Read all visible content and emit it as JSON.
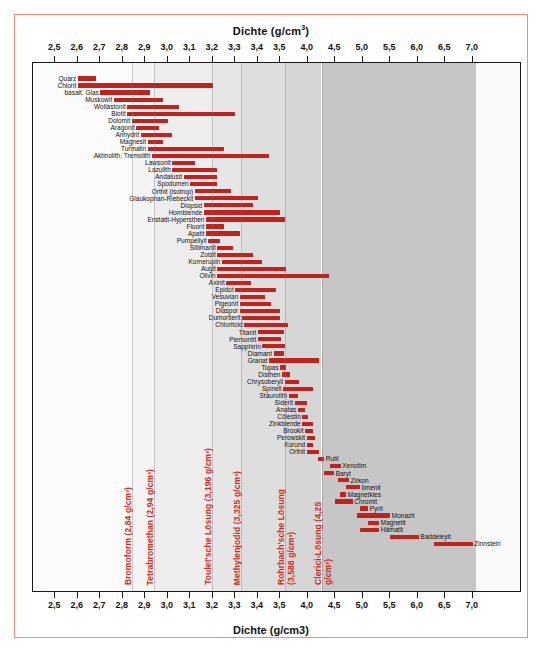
{
  "titles": {
    "top": "Dichte (g/cm",
    "top_sup": "3",
    "top_close": ")",
    "bottom": "Dichte (g/cm3)"
  },
  "axis": {
    "label": "Dichte (g/cm³)",
    "ticks": [
      "2,5",
      "2,6",
      "2,7",
      "2,8",
      "2,9",
      "3,0",
      "3,1",
      "3,2",
      "3,3",
      "3,4",
      "3,5",
      "4,0",
      "4,5",
      "5,0",
      "5,5",
      "6,0",
      "6,5",
      "7,0"
    ],
    "tick_values": [
      2.5,
      2.6,
      2.7,
      2.8,
      2.9,
      3.0,
      3.1,
      3.2,
      3.3,
      3.4,
      3.5,
      4.0,
      4.5,
      5.0,
      5.5,
      6.0,
      6.5,
      7.0
    ],
    "segment_break": 3.5,
    "min": 2.45,
    "max": 7.05
  },
  "colors": {
    "bar": "#c0221d",
    "solution_text": "#d22b20",
    "frame": "#f08c80",
    "plot_border": "#1a1a1a"
  },
  "solutions": [
    {
      "name": "Bromoform",
      "density": "2,84 g/cm³",
      "label": "Bromoform (2,84 g/cm³)",
      "value": 2.84
    },
    {
      "name": "Tetrabromethan",
      "density": "2,94 g/cm³",
      "label": "Tetrabromethan (2,94 g/cm³)",
      "value": 2.94
    },
    {
      "name": "Toulet'sche Lösung",
      "density": "3,196 g/cm³",
      "label": "Toulet'sche Lösung (3,196 g/cm³)",
      "value": 3.196
    },
    {
      "name": "Methylenjodid",
      "density": "3,325 g/cm³",
      "label": "Methylenjodid (3,325 g/cm³)",
      "value": 3.325
    },
    {
      "name": "Rohrbach'sche Lösung",
      "density": "3,588 g/cm³",
      "label": "Rohrbach'sche Lösung (3,588 g/cm³)",
      "value": 3.588
    },
    {
      "name": "Clerici-Lösung",
      "density": "4,25 g/cm³",
      "label": "Clerici-Lösung (4,25 g/cm³)",
      "value": 4.25
    }
  ],
  "chart_data": {
    "type": "bar",
    "orientation": "horizontal-range",
    "xlabel": "Dichte (g/cm³)",
    "ylabel": "",
    "xlim": [
      2.45,
      7.05
    ],
    "grid": false,
    "legend": "none",
    "note": "Broken/compressed x-axis: 2.5-3.5 in 0.1 steps, 4.0-7.0 in 0.5 steps",
    "categories": [
      "Quarz",
      "Chlorit",
      "basalt. Glas",
      "Muskowit",
      "Wollastonit",
      "Biotit",
      "Dolomit",
      "Aragonit",
      "Anhydrit",
      "Magnesit",
      "Turmalin",
      "Aktinolith, Tremolith",
      "Lawsonit",
      "Lazulith",
      "Andalusit",
      "Spodumen",
      "Orthit (isotrop)",
      "Glaukophan-Riebeckit",
      "Diopsid",
      "Hornblende",
      "Enstatit-Hypersthen",
      "Fluorit",
      "Apatit",
      "Pumpellyit",
      "Sillimanit",
      "Zoisit",
      "Kornerupin",
      "Augit",
      "Olivin",
      "Axinit",
      "Epidot",
      "Vesuvian",
      "Pigeonit",
      "Diaspor",
      "Dumortierit",
      "Chloritoid",
      "Titanit",
      "Piemontit",
      "Sapphirin",
      "Diamant",
      "Granat",
      "Topas",
      "Disthen",
      "Chrysoberyll",
      "Spinell",
      "Staurolith",
      "Siderit",
      "Anatas",
      "Cölestin",
      "Zinkblende",
      "Brookit",
      "Perowskit",
      "Korund",
      "Orthit",
      "Rutil",
      "Xenotim",
      "Baryt",
      "Zirkon",
      "Ilmenit",
      "Magnetkies",
      "Chromit",
      "Pyrit",
      "Monazit",
      "Magnetit",
      "Hämatit",
      "Baddeleyit",
      "Zinnstein"
    ],
    "ranges": [
      {
        "name": "Quarz",
        "min": 2.6,
        "max": 2.68,
        "label_side": "left"
      },
      {
        "name": "Chlorit",
        "min": 2.6,
        "max": 3.2,
        "label_side": "left"
      },
      {
        "name": "basalt. Glas",
        "min": 2.7,
        "max": 2.92,
        "label_side": "left"
      },
      {
        "name": "Muskowit",
        "min": 2.76,
        "max": 2.98,
        "label_side": "left"
      },
      {
        "name": "Wollastonit",
        "min": 2.82,
        "max": 3.05,
        "label_side": "left"
      },
      {
        "name": "Biotit",
        "min": 2.82,
        "max": 3.3,
        "label_side": "left"
      },
      {
        "name": "Dolomit",
        "min": 2.84,
        "max": 3.0,
        "label_side": "left"
      },
      {
        "name": "Aragonit",
        "min": 2.86,
        "max": 2.96,
        "label_side": "left"
      },
      {
        "name": "Anhydrit",
        "min": 2.88,
        "max": 3.02,
        "label_side": "left"
      },
      {
        "name": "Magnesit",
        "min": 2.91,
        "max": 2.98,
        "label_side": "left"
      },
      {
        "name": "Turmalin",
        "min": 2.91,
        "max": 3.25,
        "label_side": "left"
      },
      {
        "name": "Aktinolith, Tremolith",
        "min": 2.93,
        "max": 3.45,
        "label_side": "left"
      },
      {
        "name": "Lawsonit",
        "min": 3.02,
        "max": 3.12,
        "label_side": "left"
      },
      {
        "name": "Lazulith",
        "min": 3.02,
        "max": 3.22,
        "label_side": "left"
      },
      {
        "name": "Andalusit",
        "min": 3.07,
        "max": 3.22,
        "label_side": "left"
      },
      {
        "name": "Spodumen",
        "min": 3.1,
        "max": 3.22,
        "label_side": "left"
      },
      {
        "name": "Orthit (isotrop)",
        "min": 3.12,
        "max": 3.28,
        "label_side": "left"
      },
      {
        "name": "Glaukophan-Riebeckit",
        "min": 3.12,
        "max": 3.4,
        "label_side": "left"
      },
      {
        "name": "Diopsid",
        "min": 3.16,
        "max": 3.38,
        "label_side": "left"
      },
      {
        "name": "Hornblende",
        "min": 3.16,
        "max": 3.5,
        "label_side": "left"
      },
      {
        "name": "Enstatit-Hypersthen",
        "min": 3.17,
        "max": 3.58,
        "label_side": "left"
      },
      {
        "name": "Fluorit",
        "min": 3.17,
        "max": 3.25,
        "label_side": "left"
      },
      {
        "name": "Apatit",
        "min": 3.17,
        "max": 3.32,
        "label_side": "left"
      },
      {
        "name": "Pumpellyit",
        "min": 3.18,
        "max": 3.23,
        "label_side": "left"
      },
      {
        "name": "Sillimanit",
        "min": 3.22,
        "max": 3.29,
        "label_side": "left"
      },
      {
        "name": "Zoisit",
        "min": 3.22,
        "max": 3.38,
        "label_side": "left"
      },
      {
        "name": "Kornerupin",
        "min": 3.24,
        "max": 3.42,
        "label_side": "left"
      },
      {
        "name": "Augit",
        "min": 3.22,
        "max": 3.6,
        "label_side": "left"
      },
      {
        "name": "Olivin",
        "min": 3.22,
        "max": 4.39,
        "label_side": "left"
      },
      {
        "name": "Axinit",
        "min": 3.26,
        "max": 3.37,
        "label_side": "left"
      },
      {
        "name": "Epidot",
        "min": 3.3,
        "max": 3.48,
        "label_side": "left"
      },
      {
        "name": "Vesuvian",
        "min": 3.32,
        "max": 3.43,
        "label_side": "left"
      },
      {
        "name": "Pigeonit",
        "min": 3.32,
        "max": 3.46,
        "label_side": "left"
      },
      {
        "name": "Diaspor",
        "min": 3.32,
        "max": 3.5,
        "label_side": "left"
      },
      {
        "name": "Dumortierit",
        "min": 3.33,
        "max": 3.5,
        "label_side": "left"
      },
      {
        "name": "Chloritoid",
        "min": 3.34,
        "max": 3.64,
        "label_side": "left"
      },
      {
        "name": "Titanit",
        "min": 3.4,
        "max": 3.56,
        "label_side": "left"
      },
      {
        "name": "Piemontit",
        "min": 3.4,
        "max": 3.52,
        "label_side": "left"
      },
      {
        "name": "Sapphirin",
        "min": 3.42,
        "max": 3.58,
        "label_side": "left"
      },
      {
        "name": "Diamant",
        "min": 3.47,
        "max": 3.56,
        "label_side": "left"
      },
      {
        "name": "Granat",
        "min": 3.45,
        "max": 4.2,
        "label_side": "left"
      },
      {
        "name": "Topas",
        "min": 3.5,
        "max": 3.6,
        "label_side": "left"
      },
      {
        "name": "Disthen",
        "min": 3.53,
        "max": 3.68,
        "label_side": "left"
      },
      {
        "name": "Chrysoberyll",
        "min": 3.58,
        "max": 3.84,
        "label_side": "left"
      },
      {
        "name": "Spinell",
        "min": 3.55,
        "max": 4.1,
        "label_side": "left"
      },
      {
        "name": "Staurolith",
        "min": 3.65,
        "max": 3.83,
        "label_side": "left"
      },
      {
        "name": "Siderit",
        "min": 3.76,
        "max": 3.98,
        "label_side": "left"
      },
      {
        "name": "Anatas",
        "min": 3.82,
        "max": 3.95,
        "label_side": "left"
      },
      {
        "name": "Cölestin",
        "min": 3.9,
        "max": 4.0,
        "label_side": "left"
      },
      {
        "name": "Zinkblende",
        "min": 3.9,
        "max": 4.1,
        "label_side": "left"
      },
      {
        "name": "Brookit",
        "min": 3.95,
        "max": 4.1,
        "label_side": "left"
      },
      {
        "name": "Perowskit",
        "min": 3.98,
        "max": 4.13,
        "label_side": "left"
      },
      {
        "name": "Korund",
        "min": 3.98,
        "max": 4.1,
        "label_side": "left"
      },
      {
        "name": "Orthit",
        "min": 3.98,
        "max": 4.2,
        "label_side": "left"
      },
      {
        "name": "Rutil",
        "min": 4.18,
        "max": 4.3,
        "label_side": "right"
      },
      {
        "name": "Xenotim",
        "min": 4.4,
        "max": 4.6,
        "label_side": "right"
      },
      {
        "name": "Baryt",
        "min": 4.3,
        "max": 4.48,
        "label_side": "right"
      },
      {
        "name": "Zirkon",
        "min": 4.55,
        "max": 4.75,
        "label_side": "right"
      },
      {
        "name": "Ilmenit",
        "min": 4.7,
        "max": 4.95,
        "label_side": "right"
      },
      {
        "name": "Magnetkies",
        "min": 4.58,
        "max": 4.7,
        "label_side": "right"
      },
      {
        "name": "Chromit",
        "min": 4.5,
        "max": 4.82,
        "label_side": "right"
      },
      {
        "name": "Pyrit",
        "min": 4.95,
        "max": 5.1,
        "label_side": "right"
      },
      {
        "name": "Monazit",
        "min": 4.9,
        "max": 5.5,
        "label_side": "right"
      },
      {
        "name": "Magnetit",
        "min": 5.1,
        "max": 5.3,
        "label_side": "right"
      },
      {
        "name": "Hämatit",
        "min": 4.95,
        "max": 5.3,
        "label_side": "right"
      },
      {
        "name": "Baddeleyit",
        "min": 5.5,
        "max": 6.02,
        "label_side": "right"
      },
      {
        "name": "Zinnstein",
        "min": 6.3,
        "max": 7.0,
        "label_side": "right"
      }
    ]
  }
}
